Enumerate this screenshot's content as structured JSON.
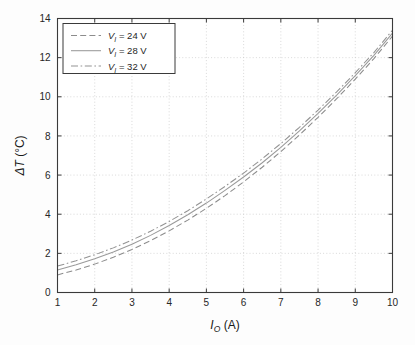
{
  "chart_data": {
    "type": "line",
    "title": "",
    "xlabel": "I_O (A)",
    "ylabel": "ΔT (°C)",
    "xlabel_parts": {
      "symbol": "I",
      "subscript": "O",
      "unit": "(A)"
    },
    "ylabel_parts": {
      "symbol": "ΔT",
      "unit": "(°C)"
    },
    "xlim": [
      1,
      10
    ],
    "ylim": [
      0,
      14
    ],
    "xticks": [
      1,
      2,
      3,
      4,
      5,
      6,
      7,
      8,
      9,
      10
    ],
    "yticks": [
      0,
      2,
      4,
      6,
      8,
      10,
      12,
      14
    ],
    "xtick_labels": [
      "1",
      "2",
      "3",
      "4",
      "5",
      "6",
      "7",
      "8",
      "9",
      "10"
    ],
    "ytick_labels": [
      "0",
      "2",
      "4",
      "6",
      "8",
      "10",
      "12",
      "14"
    ],
    "grid": true,
    "grid_style": "dotted",
    "grid_color": "#c8c8c8",
    "legend_position": "upper-left",
    "x": [
      1,
      1.5,
      2,
      2.5,
      3,
      3.5,
      4,
      4.5,
      5,
      5.5,
      6,
      6.5,
      7,
      7.5,
      8,
      8.5,
      9,
      9.5,
      10
    ],
    "series": [
      {
        "name": "V_I = 24 V",
        "label_symbol": "V",
        "label_subscript": "I",
        "label_value": "= 24 V",
        "linestyle": "dashed",
        "color": "#8c8c8c",
        "values": [
          0.9,
          1.15,
          1.45,
          1.8,
          2.2,
          2.65,
          3.15,
          3.7,
          4.3,
          4.95,
          5.65,
          6.4,
          7.2,
          8.05,
          8.95,
          9.9,
          10.9,
          11.95,
          13.1
        ]
      },
      {
        "name": "V_I = 28 V",
        "label_symbol": "V",
        "label_subscript": "I",
        "label_value": "= 28 V",
        "linestyle": "solid",
        "color": "#9a9a9a",
        "values": [
          1.15,
          1.42,
          1.72,
          2.07,
          2.47,
          2.92,
          3.42,
          3.97,
          4.57,
          5.22,
          5.9,
          6.63,
          7.42,
          8.26,
          9.15,
          10.09,
          11.08,
          12.12,
          13.25
        ]
      },
      {
        "name": "V_I = 32 V",
        "label_symbol": "V",
        "label_subscript": "I",
        "label_value": "= 32 V",
        "linestyle": "dashdot",
        "color": "#939393",
        "values": [
          1.35,
          1.62,
          1.93,
          2.28,
          2.68,
          3.13,
          3.63,
          4.18,
          4.78,
          5.42,
          6.1,
          6.83,
          7.61,
          8.44,
          9.32,
          10.25,
          11.23,
          12.26,
          13.4
        ]
      }
    ]
  },
  "legend": {
    "entries": [
      {
        "symbol": "V",
        "subscript": "I",
        "text": "= 24 V"
      },
      {
        "symbol": "V",
        "subscript": "I",
        "text": "= 28 V"
      },
      {
        "symbol": "V",
        "subscript": "I",
        "text": "= 32 V"
      }
    ]
  },
  "colors": {
    "axis": "#3a3a3a",
    "grid": "#c8c8c8",
    "curve": "#909090",
    "background": "#fdfdfd",
    "text": "#1f1f1f"
  }
}
